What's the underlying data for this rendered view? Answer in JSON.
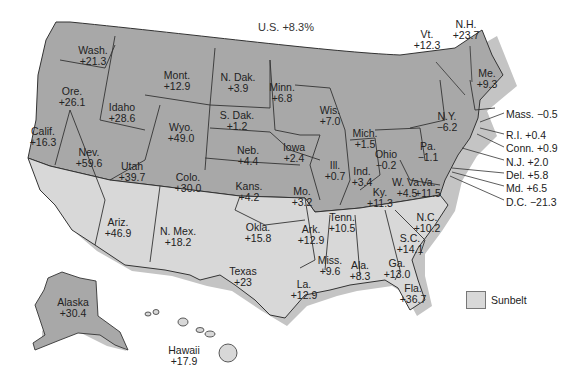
{
  "title": "U.S. +8.3%",
  "colors": {
    "nonsunbelt": "#a8a8a8",
    "sunbelt": "#d8d8d8",
    "shadow": "#c4c4c4",
    "border": "#333333"
  },
  "legend": {
    "label": "Sunbelt"
  },
  "states": [
    {
      "name": "Wash.",
      "value": "+21.3",
      "x": 93,
      "y": 45,
      "region": "nonsunbelt"
    },
    {
      "name": "Ore.",
      "value": "+26.1",
      "x": 72,
      "y": 86,
      "region": "nonsunbelt"
    },
    {
      "name": "Idaho",
      "value": "+28.6",
      "x": 122,
      "y": 102,
      "region": "nonsunbelt"
    },
    {
      "name": "Mont.",
      "value": "+12.9",
      "x": 177,
      "y": 70,
      "region": "nonsunbelt"
    },
    {
      "name": "Wyo.",
      "value": "+49.0",
      "x": 181,
      "y": 122,
      "region": "nonsunbelt"
    },
    {
      "name": "Calif.",
      "value": "+16.3",
      "x": 43,
      "y": 126,
      "region": "nonsunbelt"
    },
    {
      "name": "Nev.",
      "value": "+59.6",
      "x": 89,
      "y": 147,
      "region": "nonsunbelt"
    },
    {
      "name": "Utah",
      "value": "+39.7",
      "x": 132,
      "y": 161,
      "region": "nonsunbelt"
    },
    {
      "name": "Colo.",
      "value": "+30.0",
      "x": 188,
      "y": 172,
      "region": "nonsunbelt"
    },
    {
      "name": "N. Dak.",
      "value": "+3.9",
      "x": 238,
      "y": 72,
      "region": "nonsunbelt"
    },
    {
      "name": "S. Dak.",
      "value": "+1.2",
      "x": 237,
      "y": 110,
      "region": "nonsunbelt"
    },
    {
      "name": "Neb.",
      "value": "+4.4",
      "x": 248,
      "y": 145,
      "region": "nonsunbelt"
    },
    {
      "name": "Kans.",
      "value": "+4.2",
      "x": 249,
      "y": 181,
      "region": "nonsunbelt"
    },
    {
      "name": "Minn.",
      "value": "+6.8",
      "x": 282,
      "y": 82,
      "region": "nonsunbelt"
    },
    {
      "name": "Iowa",
      "value": "+2.4",
      "x": 294,
      "y": 142,
      "region": "nonsunbelt"
    },
    {
      "name": "Mo.",
      "value": "+3.2",
      "x": 302,
      "y": 186,
      "region": "nonsunbelt"
    },
    {
      "name": "Wis.",
      "value": "+7.0",
      "x": 330,
      "y": 105,
      "region": "nonsunbelt"
    },
    {
      "name": "Ill.",
      "value": "+0.7",
      "x": 335,
      "y": 160,
      "region": "nonsunbelt"
    },
    {
      "name": "Ind.",
      "value": "+3.4",
      "x": 362,
      "y": 166,
      "region": "nonsunbelt"
    },
    {
      "name": "Mich.",
      "value": "+1.5",
      "x": 365,
      "y": 128,
      "region": "nonsunbelt"
    },
    {
      "name": "Ohio",
      "value": "-0.2",
      "x": 386,
      "y": 149,
      "region": "nonsunbelt"
    },
    {
      "name": "Ky.",
      "value": "+11.3",
      "x": 380,
      "y": 187,
      "region": "nonsunbelt"
    },
    {
      "name": "W. Va.",
      "value": "+4.5",
      "x": 407,
      "y": 177,
      "region": "nonsunbelt"
    },
    {
      "name": "Va.",
      "value": "+11.5",
      "x": 428,
      "y": 177,
      "region": "nonsunbelt"
    },
    {
      "name": "Pa.",
      "value": "-1.1",
      "x": 428,
      "y": 141,
      "region": "nonsunbelt"
    },
    {
      "name": "N.Y.",
      "value": "-6.2",
      "x": 447,
      "y": 111,
      "region": "nonsunbelt"
    },
    {
      "name": "Me.",
      "value": "+9.3",
      "x": 487,
      "y": 68,
      "region": "nonsunbelt"
    },
    {
      "name": "Alaska",
      "value": "+30.4",
      "x": 73,
      "y": 297,
      "region": "nonsunbelt"
    },
    {
      "name": "Calif. (south)",
      "value": "",
      "x": 0,
      "y": 0,
      "region": "sunbelt"
    },
    {
      "name": "Ariz.",
      "value": "+46.9",
      "x": 118,
      "y": 217,
      "region": "sunbelt"
    },
    {
      "name": "N. Mex.",
      "value": "+18.2",
      "x": 178,
      "y": 226,
      "region": "sunbelt"
    },
    {
      "name": "Texas",
      "value": "+23",
      "x": 243,
      "y": 266,
      "region": "sunbelt"
    },
    {
      "name": "Okla.",
      "value": "+15.8",
      "x": 258,
      "y": 222,
      "region": "sunbelt"
    },
    {
      "name": "Ark.",
      "value": "+12.9",
      "x": 311,
      "y": 224,
      "region": "sunbelt"
    },
    {
      "name": "La.",
      "value": "+12.9",
      "x": 304,
      "y": 279,
      "region": "sunbelt"
    },
    {
      "name": "Miss.",
      "value": "+9.6",
      "x": 330,
      "y": 255,
      "region": "sunbelt"
    },
    {
      "name": "Tenn.",
      "value": "+10.5",
      "x": 342,
      "y": 212,
      "region": "sunbelt"
    },
    {
      "name": "Ala.",
      "value": "+8.3",
      "x": 360,
      "y": 260,
      "region": "sunbelt"
    },
    {
      "name": "Ga.",
      "value": "+13.0",
      "x": 397,
      "y": 258,
      "region": "sunbelt"
    },
    {
      "name": "S.C.",
      "value": "+14.1",
      "x": 410,
      "y": 233,
      "region": "sunbelt"
    },
    {
      "name": "N.C.",
      "value": "+10.2",
      "x": 427,
      "y": 212,
      "region": "sunbelt"
    },
    {
      "name": "Fla.",
      "value": "+36.7",
      "x": 413,
      "y": 283,
      "region": "sunbelt"
    },
    {
      "name": "Hawaii",
      "value": "+17.9",
      "x": 184,
      "y": 345,
      "region": "sunbelt"
    }
  ],
  "callouts": [
    {
      "name": "Vt.",
      "value": "+12.3",
      "x": 427,
      "y": 40
    },
    {
      "name": "N.H.",
      "value": "+23.7",
      "x": 466,
      "y": 30
    },
    {
      "name": "Mass.",
      "value": "-0.5",
      "label": "Mass.  −0.5",
      "x": 506,
      "y": 109
    },
    {
      "name": "R.I.",
      "value": "+0.4",
      "label": "R.I.  +0.4",
      "x": 506,
      "y": 130
    },
    {
      "name": "Conn.",
      "value": "+0.9",
      "label": "Conn.  +0.9",
      "x": 506,
      "y": 143
    },
    {
      "name": "N.J.",
      "value": "+2.0",
      "label": "N.J.  +2.0",
      "x": 506,
      "y": 157
    },
    {
      "name": "Del.",
      "value": "+5.8",
      "label": "Del.  +5.8",
      "x": 506,
      "y": 170
    },
    {
      "name": "Md.",
      "value": "+6.5",
      "label": "Md.  +6.5",
      "x": 506,
      "y": 183
    },
    {
      "name": "D.C.",
      "value": "-21.3",
      "label": "D.C.  −21.3",
      "x": 506,
      "y": 197
    }
  ]
}
